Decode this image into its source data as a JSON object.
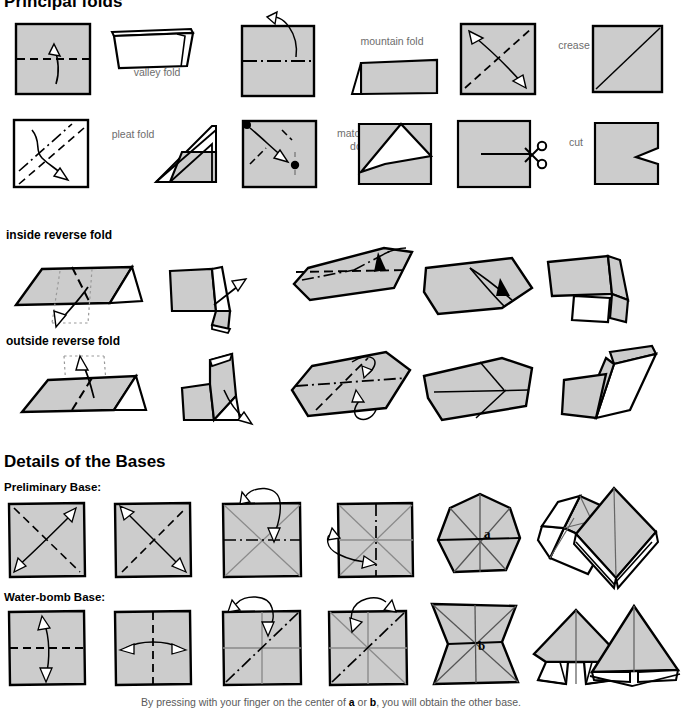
{
  "page": {
    "title": "Principal folds",
    "caption_pre": "By pressing with your finger on the center of ",
    "caption_a": "a",
    "caption_mid": " or ",
    "caption_b": "b",
    "caption_post": ", you will obtain the other base.",
    "paper_fill": "#cccccc",
    "paper_back": "#ffffff",
    "ink": "#000000",
    "label_gray": "#6d6d6d"
  },
  "sections": {
    "principal_folds": {
      "title": "Principal folds",
      "labels": [
        {
          "id": "valley-fold",
          "text": "valley fold"
        },
        {
          "id": "mountain-fold",
          "text": "mountain fold"
        },
        {
          "id": "crease",
          "text": "crease"
        },
        {
          "id": "pleat-fold",
          "text": "pleat fold"
        },
        {
          "id": "match-the-dots",
          "text": "match the\ndots"
        },
        {
          "id": "cut",
          "text": "cut"
        }
      ]
    },
    "inside_reverse": {
      "title": "inside reverse fold",
      "step_count": 5
    },
    "outside_reverse": {
      "title": "outside reverse fold",
      "step_count": 5
    },
    "bases": {
      "title": "Details of the Bases",
      "preliminary": {
        "title": "Preliminary Base:",
        "step_count": 7,
        "marker": "a"
      },
      "waterbomb": {
        "title": "Water-bomb Base:",
        "step_count": 7,
        "marker": "b"
      }
    }
  }
}
